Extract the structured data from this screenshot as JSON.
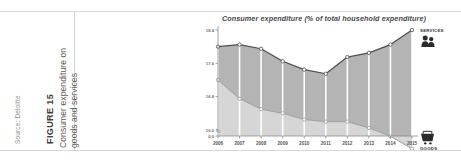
{
  "figure": {
    "source": "Source: Deloitte",
    "label": "FIGURE 15",
    "title_line1": "Consumer expenditure on",
    "title_line2": "goods and services"
  },
  "legend": {
    "services_label": "SERVICES",
    "services_icon": "people-icon",
    "goods_label": "GOODS",
    "goods_icon": "shopping-cart-icon"
  },
  "colors": {
    "services_fill": "#b4b4b4",
    "goods_fill": "#d6d6d6",
    "services_line": "#4d4d4d",
    "goods_line": "#9a9a9a",
    "gridline": "#ffffff",
    "axis": "#8c8c8c",
    "page_rule": "#d8d8d8"
  },
  "chart_data": {
    "type": "area",
    "title": "Consumer expenditure (% of total household expenditure)",
    "xlabel": "",
    "ylabel": "",
    "categories": [
      "2006",
      "2007",
      "2008",
      "2009",
      "2010",
      "2011",
      "2012",
      "2013",
      "2014",
      "2015"
    ],
    "series": [
      {
        "name": "SERVICES",
        "values": [
          18.0,
          18.05,
          17.95,
          17.65,
          17.45,
          17.35,
          17.75,
          17.85,
          18.05,
          18.4
        ]
      },
      {
        "name": "GOODS",
        "values": [
          17.2,
          16.75,
          16.5,
          16.4,
          16.25,
          16.2,
          16.2,
          16.05,
          15.85,
          15.55
        ]
      }
    ],
    "yticks": [
      "18.4",
      "17.6",
      "16.8",
      "16.0",
      "0.0"
    ],
    "ytick_values": [
      18.4,
      17.6,
      16.8,
      16.0,
      0.0
    ],
    "ylim": [
      16.0,
      18.4
    ],
    "axis_break": true,
    "grid": true,
    "legend_position": "right"
  }
}
